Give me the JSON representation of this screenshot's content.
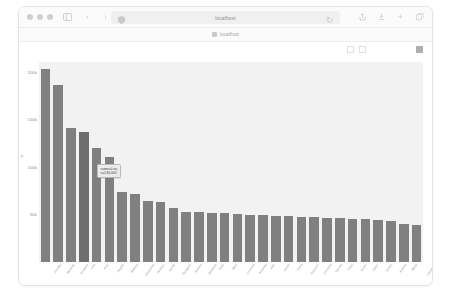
{
  "window": {
    "traffic_lights": [
      "close",
      "minimize",
      "zoom"
    ],
    "sidebar_icon": "sidebar-icon",
    "back_icon": "chevron-left-icon",
    "forward_icon": "chevron-right-icon",
    "shield_icon": "shield-icon",
    "reload_icon": "reload-icon",
    "url_text": "localhost",
    "right_icons": [
      "share-icon",
      "downloads-icon",
      "new-tab-icon",
      "tab-overview-icon"
    ]
  },
  "bookmarks": {
    "favicon": "page-favicon",
    "label": "localhost"
  },
  "plot_toolbar": {
    "items": [
      {
        "name": "home-icon",
        "style": "light"
      },
      {
        "name": "pan-icon",
        "style": "strong"
      },
      {
        "name": "zoom-icon",
        "style": "light"
      },
      {
        "name": "box-select-icon",
        "style": "box"
      },
      {
        "name": "lasso-select-icon",
        "style": "box"
      },
      {
        "name": "zoom-in-icon",
        "style": "light"
      },
      {
        "name": "zoom-out-icon",
        "style": "light"
      },
      {
        "name": "autoscale-icon",
        "style": "light"
      },
      {
        "name": "reset-axes-icon",
        "style": "light"
      },
      {
        "name": "download-plot-icon",
        "style": "filled"
      }
    ]
  },
  "chart_data": {
    "type": "bar",
    "title": "",
    "xlabel": "name",
    "ylabel": "n",
    "ylim": [
      0,
      210000
    ],
    "yticks": [
      50000,
      100000,
      150000,
      200000
    ],
    "ytick_labels": [
      "50k",
      "100k",
      "150k",
      "200k"
    ],
    "grid": false,
    "legend": false,
    "bar_color": "#808080",
    "plot_bg": "#f2f2f2",
    "categories": [
      "Jennifer",
      "Michelle",
      "Kimberly",
      "Lisa",
      "Amy",
      "Angela",
      "Melissa",
      "Stephanie",
      "Heather",
      "Nicole",
      "Elizabeth",
      "Jessica",
      "Rebecca",
      "Kelly",
      "Mary",
      "Christina",
      "Amanda",
      "Julie",
      "Sarah",
      "Laura",
      "Shannon",
      "Christine",
      "Tammy",
      "Tracy",
      "Karen",
      "Dawn",
      "Susan",
      "Andrea",
      "Maria",
      "Catherine"
    ],
    "values": [
      203000,
      186000,
      141000,
      136000,
      120000,
      110000,
      73000,
      71000,
      64000,
      63000,
      57000,
      53000,
      52000,
      51000,
      51000,
      50000,
      49000,
      49000,
      48000,
      48000,
      47000,
      47000,
      46000,
      46000,
      45000,
      45000,
      44000,
      43000,
      40000,
      39000
    ]
  },
  "tooltip": {
    "visible": true,
    "hovered_index": 3,
    "line1": "name=Lisa",
    "line2": "n=136,000"
  }
}
